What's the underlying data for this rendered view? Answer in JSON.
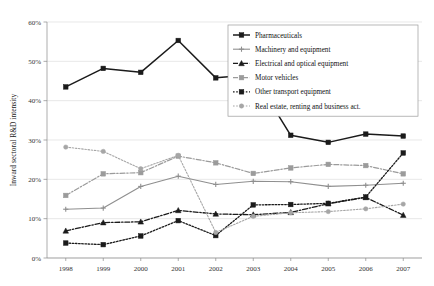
{
  "chart_data": {
    "type": "line",
    "title": "",
    "xlabel": "",
    "ylabel": "Inward sectoral  R&D intensity",
    "x": [
      1998,
      1999,
      2000,
      2001,
      2002,
      2003,
      2004,
      2005,
      2006,
      2007
    ],
    "xtick_labels": [
      "1998",
      "1999",
      "2000",
      "2001",
      "2002",
      "2003",
      "2004",
      "2005",
      "2006",
      "2007"
    ],
    "ytick_labels": [
      "0%",
      "10%",
      "20%",
      "30%",
      "40%",
      "50%",
      "60%"
    ],
    "ytick_values": [
      0,
      10,
      20,
      30,
      40,
      50,
      60
    ],
    "ylim": [
      0,
      60
    ],
    "grid": "horizontal",
    "legend_position": "top-right",
    "value_suffix": "%",
    "series": [
      {
        "name": "Pharmaceuticals",
        "values": [
          43.5,
          48.2,
          47.2,
          55.3,
          45.8,
          46.6,
          31.2,
          29.4,
          31.5,
          31.0
        ],
        "color": "#1b1b1b",
        "marker": "square",
        "dash": "none",
        "width": 1.5
      },
      {
        "name": "Machinery and equipment",
        "values": [
          12.4,
          12.7,
          18.2,
          20.8,
          18.7,
          19.5,
          19.4,
          18.2,
          18.5,
          19.0
        ],
        "color": "#8f8f8f",
        "marker": "plus",
        "dash": "none",
        "width": 1.1
      },
      {
        "name": "Electrical and optical equipment",
        "values": [
          6.9,
          9.0,
          9.2,
          12.1,
          11.2,
          11.0,
          11.6,
          13.8,
          15.4,
          10.9
        ],
        "color": "#1b1b1b",
        "marker": "triangle",
        "dash": "dashdot",
        "width": 1.3
      },
      {
        "name": "Motor vehicles",
        "values": [
          15.9,
          21.4,
          21.7,
          25.9,
          24.2,
          21.5,
          22.9,
          23.8,
          23.5,
          21.4
        ],
        "color": "#9b9b9b",
        "marker": "square",
        "dash": "dashdot",
        "width": 1.2
      },
      {
        "name": "Other transport equipment",
        "values": [
          3.8,
          3.4,
          5.6,
          9.5,
          5.7,
          13.5,
          13.6,
          13.9,
          15.5,
          26.7
        ],
        "color": "#1b1b1b",
        "marker": "square",
        "dash": "dotted",
        "width": 1.3
      },
      {
        "name": "Real estate, renting and business act.",
        "values": [
          28.2,
          27.1,
          22.7,
          26.1,
          6.5,
          10.6,
          11.5,
          11.8,
          12.5,
          13.7
        ],
        "color": "#a6a6a6",
        "marker": "circle",
        "dash": "dotted",
        "width": 1.1
      }
    ]
  }
}
